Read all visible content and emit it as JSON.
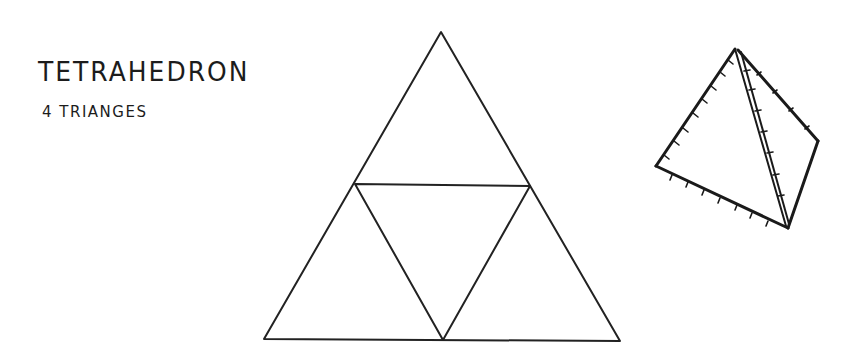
{
  "title": "TETRAHEDRON",
  "subtitle": "4 TRIANGES",
  "net": {
    "type": "tetrahedron-net",
    "triangle_count": 4,
    "outer_vertices": [
      [
        441,
        32
      ],
      [
        264,
        339
      ],
      [
        620,
        341
      ]
    ],
    "midpoints": [
      [
        355,
        184
      ],
      [
        530,
        186
      ],
      [
        443,
        340
      ]
    ],
    "stroke": "#222222"
  },
  "sketch": {
    "type": "3d-tetrahedron-sketch",
    "vertices": [
      [
        735,
        48
      ],
      [
        656,
        165
      ],
      [
        788,
        228
      ],
      [
        818,
        140
      ]
    ],
    "stroke": "#1a1a1a"
  }
}
